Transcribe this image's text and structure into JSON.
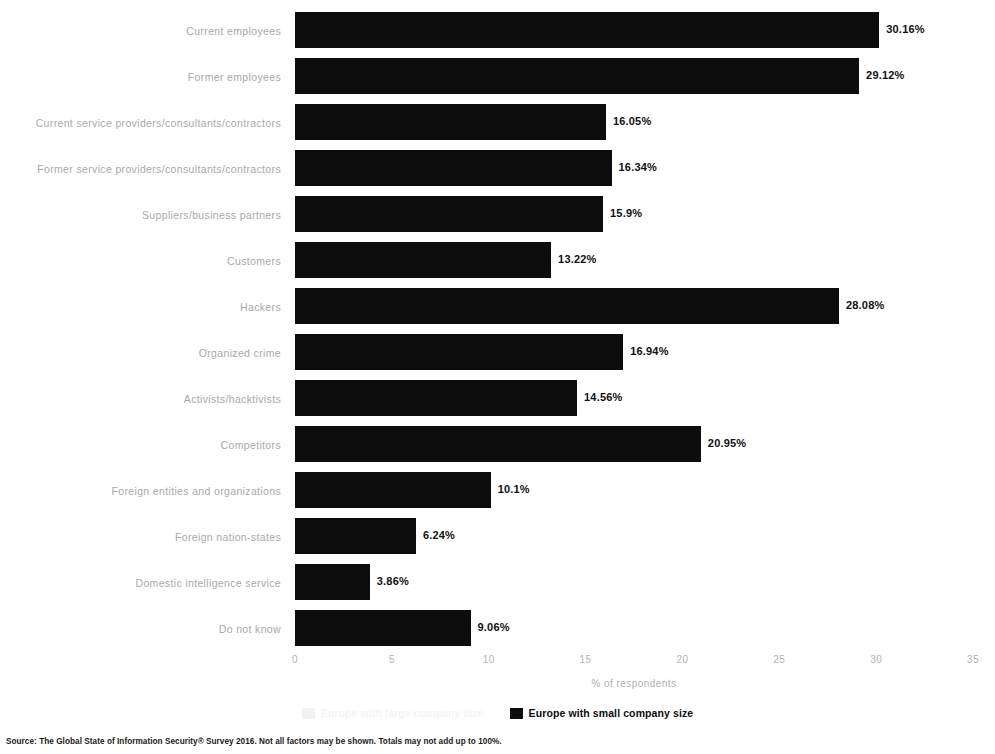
{
  "chart_data": {
    "type": "bar",
    "orientation": "horizontal",
    "title": "",
    "subtitle": "",
    "xlabel": "% of respondents",
    "ylabel": "",
    "xlim": [
      0,
      35
    ],
    "xticks": [
      "0",
      "5",
      "10",
      "15",
      "20",
      "25",
      "30",
      "35"
    ],
    "grid": false,
    "legend_position": "bottom-center",
    "categories": [
      "Current employees",
      "Former employees",
      "Current service providers/consultants/contractors",
      "Former service providers/consultants/contractors",
      "Suppliers/business partners",
      "Customers",
      "Hackers",
      "Organized crime",
      "Activists/hacktivists",
      "Competitors",
      "Foreign entities and organizations",
      "Foreign nation-states",
      "Domestic intelligence service",
      "Do not know"
    ],
    "series": [
      {
        "name": "Europe with small company size",
        "color": "#0d0d0d",
        "values": [
          30.16,
          29.12,
          16.05,
          16.34,
          15.9,
          13.22,
          28.08,
          16.94,
          14.56,
          20.95,
          10.1,
          6.24,
          3.86,
          9.06
        ],
        "value_labels": [
          "30.16%",
          "29.12%",
          "16.05%",
          "16.34%",
          "15.9%",
          "13.22%",
          "28.08%",
          "16.94%",
          "14.56%",
          "20.95%",
          "10.1%",
          "6.24%",
          "3.86%",
          "9.06%"
        ]
      }
    ],
    "legend": [
      {
        "label": "Europe with large company size",
        "color": "#f2f2f2",
        "state": "faded"
      },
      {
        "label": "Europe with small company size",
        "color": "#0d0d0d",
        "state": "solid"
      }
    ]
  },
  "source": {
    "text": "Source: The Global State of Information Security® Survey 2016. Not all factors may be shown. Totals may not add up to 100%."
  }
}
